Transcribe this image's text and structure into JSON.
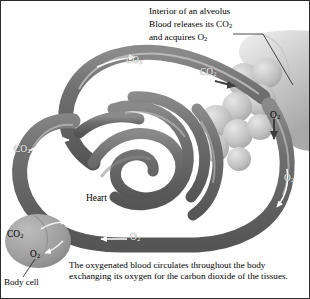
{
  "figure": {
    "title_block": {
      "line1": "Interior of an alveolus",
      "line2_pre": "Blood releases its CO",
      "line2_sub": "2",
      "line3_pre": "and acquires O",
      "line3_sub": "2"
    },
    "caption": "The oxygenated blood circulates throughout the body exchanging its oxygen for the carbon dioxide of the tissues.",
    "labels": {
      "heart": "Heart",
      "body_cell": "Body cell"
    },
    "gases": {
      "co2_symbol": "CO",
      "co2_sub": "2",
      "o2_symbol": "O",
      "o2_sub": "2"
    },
    "gas_markers": [
      {
        "id": "co2-top",
        "gas": "CO2",
        "flow": "right",
        "region": "upper-vessel"
      },
      {
        "id": "co2-alv",
        "gas": "CO2",
        "flow": "right",
        "region": "alveolus-entry"
      },
      {
        "id": "o2-alv",
        "gas": "O2",
        "flow": "down",
        "region": "alveolus-exit"
      },
      {
        "id": "co2-left",
        "gas": "CO2",
        "flow": "right",
        "region": "left-vessel"
      },
      {
        "id": "o2-right",
        "gas": "O2",
        "flow": "down",
        "region": "right-vessel"
      },
      {
        "id": "o2-bottom",
        "gas": "O2",
        "flow": "left",
        "region": "lower-vessel"
      },
      {
        "id": "co2-cell",
        "gas": "CO2",
        "flow": "out",
        "region": "body-cell"
      },
      {
        "id": "o2-cell",
        "gas": "O2",
        "flow": "in",
        "region": "body-cell"
      }
    ],
    "colors": {
      "background": "#ffffff",
      "border": "#2b2b2b",
      "vessel_dark": "#6f6f6f",
      "vessel_shadow": "#4a4a4a",
      "vessel_highlight": "#c9c9c9",
      "alveolus": "#b9b9b9",
      "alveolus_light": "#d8d8d8",
      "cell": "#9b9b9b",
      "text": "#000000",
      "text_on_vessel": "#ffffff"
    }
  }
}
